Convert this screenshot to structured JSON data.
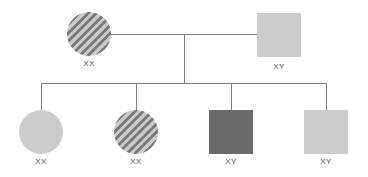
{
  "diagram": {
    "type": "pedigree",
    "parents": [
      {
        "id": "mother",
        "shape": "circle",
        "fill": "striped",
        "label": "XX"
      },
      {
        "id": "father",
        "shape": "square",
        "fill": "#cccccc",
        "label": "XY"
      }
    ],
    "children": [
      {
        "id": "child-1",
        "shape": "circle",
        "fill": "#cccccc",
        "label": "XX"
      },
      {
        "id": "child-2",
        "shape": "circle",
        "fill": "striped",
        "label": "XX"
      },
      {
        "id": "child-3",
        "shape": "square",
        "fill": "#6b6b6b",
        "label": "XY"
      },
      {
        "id": "child-4",
        "shape": "square",
        "fill": "#cccccc",
        "label": "XY"
      }
    ],
    "colors": {
      "line": "#7f7f7f",
      "light_fill": "#cccccc",
      "dark_fill": "#6b6b6b",
      "stripe_light": "#c9c9c9",
      "stripe_dark": "#7b7b7b",
      "label_text": "#555555"
    }
  }
}
